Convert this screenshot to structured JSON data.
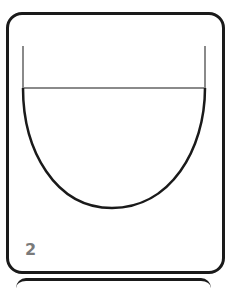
{
  "card": {
    "number": "2"
  },
  "diagram": {
    "shape": "u-shaped-bowl-with-walls",
    "colors": {
      "outline": "#1a1a1a",
      "walls": "#8a8a8a",
      "number": "#7a7a7a"
    }
  }
}
